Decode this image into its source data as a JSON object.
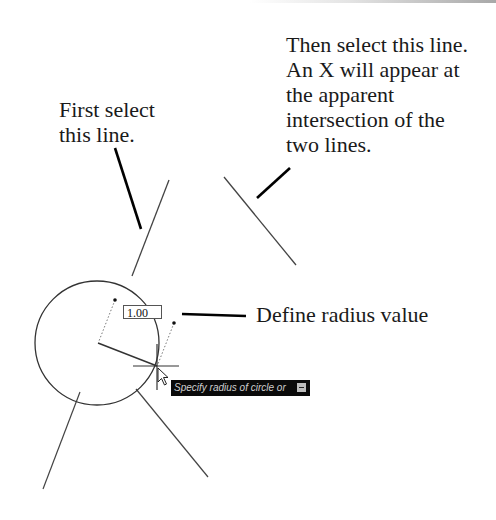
{
  "callouts": {
    "second_line": "Then select this line.\nAn X will appear at\nthe apparent\nintersection of the\ntwo lines.",
    "first_line": "First select\nthis line.",
    "radius": "Define radius value"
  },
  "drawing": {
    "dynamic_input_value": "1.00",
    "tooltip_text": "Specify radius of circle or",
    "tooltip_icon": "down-arrow-icon",
    "line_color": "#333333",
    "leader_color": "#000000",
    "tooltip_bg": "#0a0a0a"
  }
}
